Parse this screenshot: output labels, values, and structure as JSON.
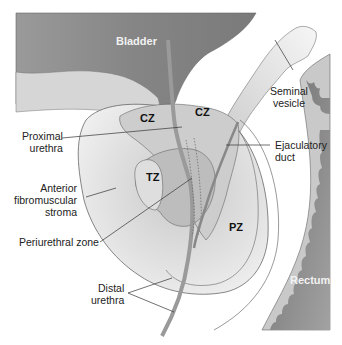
{
  "diagram": {
    "organs": {
      "bladder": "Bladder",
      "rectum": "Rectum"
    },
    "zones": {
      "cz_left": "CZ",
      "cz_right": "CZ",
      "tz": "TZ",
      "pz": "PZ"
    },
    "labels": {
      "proximal_urethra": "Proximal\nurethra",
      "anterior_fibromuscular_stroma": "Anterior\nfibromuscular\nstroma",
      "periurethral_zone": "Periurethral zone",
      "distal_urethra": "Distal\nurethra",
      "seminal_vesicle": "Seminal\nvesicle",
      "ejaculatory_duct": "Ejaculatory\nduct"
    },
    "colors": {
      "bladder": "#8a8a8a",
      "rectum": "#7d7d7d",
      "rectal_wall": "#c8c8c8",
      "prostate_outer": "#e6e6e6",
      "central_zone": "#cfcfcf",
      "transition_zone": "#d9d9d9",
      "periurethral": "#a9a9a9",
      "outline": "#555555",
      "leader": "#333333"
    }
  }
}
